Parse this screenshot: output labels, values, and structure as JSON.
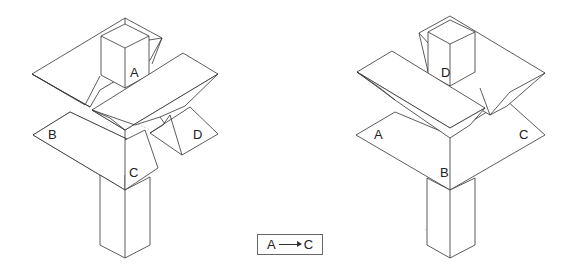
{
  "figures": {
    "left": {
      "description": "Isometric joint assembly, state before",
      "labels": {
        "a": "A",
        "b": "B",
        "c": "C",
        "d": "D"
      }
    },
    "right": {
      "description": "Isometric joint assembly, state after",
      "labels": {
        "a": "A",
        "b": "B",
        "c": "C",
        "d": "D"
      }
    }
  },
  "legend": {
    "from": "A",
    "to": "C",
    "arrow": "right-arrow"
  },
  "colors": {
    "line": "#333333",
    "hidden_line": "#bbbbbb",
    "background": "#ffffff"
  }
}
